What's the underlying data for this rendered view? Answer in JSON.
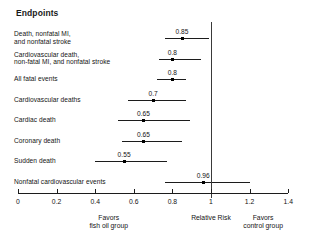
{
  "chart_data": {
    "type": "scatter",
    "title": "Endpoints",
    "xlabel": "Relative Risk",
    "ylabel": "",
    "xlim": [
      0,
      1.4
    ],
    "grid": false,
    "legend": "none",
    "reference_line": 1,
    "xticks": [
      "0",
      "0.2",
      "0.4",
      "0.6",
      "0.8",
      "1",
      "1.2",
      "1.4"
    ],
    "xtick_values": [
      0,
      0.2,
      0.4,
      0.6,
      0.8,
      1.0,
      1.2,
      1.4
    ],
    "left_caption_line1": "Favors",
    "left_caption_line2": "fish oil group",
    "center_caption": "Relative Risk",
    "right_caption_line1": "Favors",
    "right_caption_line2": "control group",
    "categories": [
      "Death, nonfatal MI, and nonfatal stroke",
      "Cardiovascular death, non-fatal MI, and nonfatal stroke",
      "All fatal events",
      "Cardiovascular deaths",
      "Cardiac death",
      "Coronary death",
      "Sudden death",
      "Nonfatal cardiovascular events"
    ],
    "values": [
      0.85,
      0.8,
      0.8,
      0.7,
      0.65,
      0.65,
      0.55,
      0.96
    ],
    "ci_low": [
      0.76,
      0.73,
      0.72,
      0.57,
      0.52,
      0.54,
      0.4,
      0.76
    ],
    "ci_high": [
      0.99,
      0.95,
      0.87,
      0.87,
      0.89,
      0.85,
      0.77,
      1.2
    ]
  },
  "rows": [
    {
      "label_lines": [
        "Death, nonfatal MI,",
        "and nonfatal stroke"
      ],
      "value_label": "0.85",
      "value": 0.85,
      "ci_low": 0.76,
      "ci_high": 0.99
    },
    {
      "label_lines": [
        "Cardiovascular death,",
        "non-fatal MI, and nonfatal stroke"
      ],
      "value_label": "0.8",
      "value": 0.8,
      "ci_low": 0.73,
      "ci_high": 0.95
    },
    {
      "label_lines": [
        "All fatal events"
      ],
      "value_label": "0.8",
      "value": 0.8,
      "ci_low": 0.72,
      "ci_high": 0.87
    },
    {
      "label_lines": [
        "Cardiovascular deaths"
      ],
      "value_label": "0.7",
      "value": 0.7,
      "ci_low": 0.57,
      "ci_high": 0.87
    },
    {
      "label_lines": [
        "Cardiac death"
      ],
      "value_label": "0.65",
      "value": 0.65,
      "ci_low": 0.52,
      "ci_high": 0.89
    },
    {
      "label_lines": [
        "Coronary death"
      ],
      "value_label": "0.65",
      "value": 0.65,
      "ci_low": 0.54,
      "ci_high": 0.85
    },
    {
      "label_lines": [
        "Sudden death"
      ],
      "value_label": "0.55",
      "value": 0.55,
      "ci_low": 0.4,
      "ci_high": 0.77
    },
    {
      "label_lines": [
        "Nonfatal cardiovascular events"
      ],
      "value_label": "0.96",
      "value": 0.96,
      "ci_low": 0.76,
      "ci_high": 1.2
    }
  ]
}
